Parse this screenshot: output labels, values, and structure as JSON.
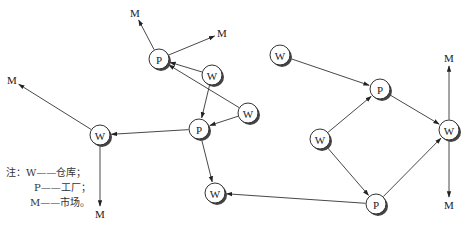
{
  "diagram": {
    "type": "network-flow",
    "node_labels": {
      "W": "W",
      "P": "P",
      "M": "M"
    },
    "networks": [
      {
        "name": "left-network",
        "nodes": [
          {
            "id": "P1",
            "label": "P",
            "x": 159,
            "y": 59
          },
          {
            "id": "W1",
            "label": "W",
            "x": 212,
            "y": 75
          },
          {
            "id": "W2",
            "label": "W",
            "x": 248,
            "y": 113
          },
          {
            "id": "P2",
            "label": "P",
            "x": 199,
            "y": 129
          },
          {
            "id": "W3",
            "label": "W",
            "x": 100,
            "y": 135
          },
          {
            "id": "W4",
            "label": "W",
            "x": 215,
            "y": 193
          }
        ],
        "markets": [
          {
            "id": "M1",
            "label": "M",
            "x": 135,
            "y": 13
          },
          {
            "id": "M2",
            "label": "M",
            "x": 222,
            "y": 33
          },
          {
            "id": "M3",
            "label": "M",
            "x": 12,
            "y": 80
          },
          {
            "id": "M4",
            "label": "M",
            "x": 100,
            "y": 214
          }
        ]
      },
      {
        "name": "right-network",
        "nodes": [
          {
            "id": "W5",
            "label": "W",
            "x": 280,
            "y": 55
          },
          {
            "id": "P3",
            "label": "P",
            "x": 380,
            "y": 89
          },
          {
            "id": "W6",
            "label": "W",
            "x": 320,
            "y": 139
          },
          {
            "id": "P4",
            "label": "P",
            "x": 376,
            "y": 204
          },
          {
            "id": "W7",
            "label": "W",
            "x": 449,
            "y": 130
          }
        ],
        "markets": [
          {
            "id": "M5",
            "label": "M",
            "x": 449,
            "y": 58
          },
          {
            "id": "M6",
            "label": "M",
            "x": 449,
            "y": 205
          }
        ]
      }
    ],
    "edges": [
      {
        "from": "P1",
        "to": "M1"
      },
      {
        "from": "P1",
        "to": "M2"
      },
      {
        "from": "W1",
        "to": "P1"
      },
      {
        "from": "W2",
        "to": "P1"
      },
      {
        "from": "W1",
        "to": "P2"
      },
      {
        "from": "W2",
        "to": "P2"
      },
      {
        "from": "P2",
        "to": "W3"
      },
      {
        "from": "P2",
        "to": "W4"
      },
      {
        "from": "W3",
        "to": "M3"
      },
      {
        "from": "W3",
        "to": "M4"
      },
      {
        "from": "W5",
        "to": "P3"
      },
      {
        "from": "W6",
        "to": "P3"
      },
      {
        "from": "W6",
        "to": "P4"
      },
      {
        "from": "P3",
        "to": "W7"
      },
      {
        "from": "P4",
        "to": "W7"
      },
      {
        "from": "P4",
        "to": "W4"
      },
      {
        "from": "W7",
        "to": "M5"
      },
      {
        "from": "W7",
        "to": "M6"
      }
    ]
  },
  "legend": {
    "note_prefix": "注：",
    "items": [
      {
        "key": "W",
        "dash": "——",
        "meaning": "仓库；"
      },
      {
        "key": "P",
        "dash": "——",
        "meaning": "工厂；"
      },
      {
        "key": "M",
        "dash": "——",
        "meaning": "市场。"
      }
    ]
  }
}
